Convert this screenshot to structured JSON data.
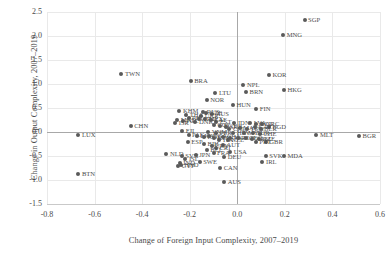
{
  "chart_data": {
    "type": "scatter",
    "title": "",
    "xlabel": "Change of Foreign Input Complexity, 2007–2019",
    "ylabel": "Change in Output Complexity, 2007–2019",
    "xlim": [
      -0.8,
      0.6
    ],
    "ylim": [
      -1.5,
      2.5
    ],
    "xticks": [
      "-0.8",
      "-0.6",
      "-0.4",
      "-0.2",
      "0.0",
      "0.2",
      "0.4",
      "0.6"
    ],
    "xtick_values": [
      -0.8,
      -0.6,
      -0.4,
      -0.2,
      0.0,
      0.2,
      0.4,
      0.6
    ],
    "yticks": [
      "2.5",
      "2.0",
      "1.5",
      "1.0",
      "0.5",
      "0.0",
      "-0.5",
      "-1.0",
      "-1.5"
    ],
    "ytick_values": [
      2.5,
      2.0,
      1.5,
      1.0,
      0.5,
      0.0,
      -0.5,
      -1.0,
      -1.5
    ],
    "grid": true,
    "legend": "none",
    "marker_color": "#5a5a5a",
    "label_color": "#4d4d4d",
    "grid_color": "#e9e9e9",
    "axis_color": "#a8a8a8",
    "points": [
      {
        "label": "SGP",
        "x": 0.283,
        "y": 2.335
      },
      {
        "label": "MNG",
        "x": 0.193,
        "y": 2.02
      },
      {
        "label": "KOR",
        "x": 0.133,
        "y": 1.18
      },
      {
        "label": "TWN",
        "x": -0.487,
        "y": 1.2
      },
      {
        "label": "HKG",
        "x": 0.196,
        "y": 0.88
      },
      {
        "label": "BRA",
        "x": -0.196,
        "y": 1.055
      },
      {
        "label": "NPL",
        "x": 0.026,
        "y": 0.975
      },
      {
        "label": "BRN",
        "x": 0.037,
        "y": 0.83
      },
      {
        "label": "LTU",
        "x": -0.092,
        "y": 0.805
      },
      {
        "label": "NOR",
        "x": -0.128,
        "y": 0.665
      },
      {
        "label": "HUN",
        "x": -0.018,
        "y": 0.56
      },
      {
        "label": "FIN",
        "x": 0.08,
        "y": 0.475
      },
      {
        "label": "KHM",
        "x": -0.243,
        "y": 0.43
      },
      {
        "label": "RUS",
        "x": -0.143,
        "y": 0.415
      },
      {
        "label": "CZE",
        "x": -0.13,
        "y": 0.395
      },
      {
        "label": "AUS2",
        "x": -0.105,
        "y": 0.38
      },
      {
        "label": "MKD",
        "x": -0.252,
        "y": 0.255
      },
      {
        "label": "POL",
        "x": -0.23,
        "y": 0.235
      },
      {
        "label": "ISR",
        "x": -0.261,
        "y": 0.195
      },
      {
        "label": "DNK",
        "x": -0.176,
        "y": 0.21
      },
      {
        "label": "EST",
        "x": -0.088,
        "y": 0.215
      },
      {
        "label": "IDN",
        "x": -0.012,
        "y": 0.19
      },
      {
        "label": "LVA",
        "x": 0.055,
        "y": 0.18
      },
      {
        "label": "ROU",
        "x": 0.08,
        "y": 0.165
      },
      {
        "label": "GRC",
        "x": 0.105,
        "y": 0.16
      },
      {
        "label": "BGD",
        "x": 0.132,
        "y": 0.11
      },
      {
        "label": "CHN",
        "x": -0.448,
        "y": 0.12
      },
      {
        "label": "LUX",
        "x": -0.668,
        "y": -0.055
      },
      {
        "label": "FJI",
        "x": -0.231,
        "y": 0.02
      },
      {
        "label": "VNM",
        "x": -0.122,
        "y": 0.01
      },
      {
        "label": "PER",
        "x": -0.088,
        "y": -0.03
      },
      {
        "label": "HRV",
        "x": -0.016,
        "y": -0.02
      },
      {
        "label": "MYS",
        "x": 0.03,
        "y": -0.015
      },
      {
        "label": "TUR",
        "x": 0.065,
        "y": -0.02
      },
      {
        "label": "CHE",
        "x": 0.095,
        "y": -0.04
      },
      {
        "label": "MLT",
        "x": 0.333,
        "y": -0.055
      },
      {
        "label": "BGR",
        "x": 0.512,
        "y": -0.085
      },
      {
        "label": "ESP",
        "x": -0.208,
        "y": -0.2
      },
      {
        "label": "ITA",
        "x": -0.075,
        "y": -0.16
      },
      {
        "label": "NZL",
        "x": -0.04,
        "y": -0.175
      },
      {
        "label": "GBR",
        "x": 0.12,
        "y": -0.215
      },
      {
        "label": "PRT",
        "x": 0.078,
        "y": -0.205
      },
      {
        "label": "AUT",
        "x": -0.06,
        "y": -0.27
      },
      {
        "label": "NLD",
        "x": -0.298,
        "y": -0.465
      },
      {
        "label": "SVN",
        "x": -0.233,
        "y": -0.51
      },
      {
        "label": "JPN",
        "x": -0.175,
        "y": -0.47
      },
      {
        "label": "DEU",
        "x": -0.055,
        "y": -0.52
      },
      {
        "label": "SWE",
        "x": -0.158,
        "y": -0.615
      },
      {
        "label": "IND",
        "x": -0.242,
        "y": -0.65
      },
      {
        "label": "CYP",
        "x": -0.248,
        "y": -0.705
      },
      {
        "label": "SVK",
        "x": 0.12,
        "y": -0.505
      },
      {
        "label": "MDA",
        "x": 0.196,
        "y": -0.5
      },
      {
        "label": "IRL",
        "x": 0.106,
        "y": -0.635
      },
      {
        "label": "CAN",
        "x": -0.072,
        "y": -0.76
      },
      {
        "label": "AUS",
        "x": -0.055,
        "y": -1.04
      },
      {
        "label": "BTN",
        "x": -0.668,
        "y": -0.865
      },
      {
        "label": "THA",
        "x": -0.215,
        "y": 0.345
      },
      {
        "label": "PHL",
        "x": -0.205,
        "y": 0.3
      },
      {
        "label": "UKR",
        "x": -0.152,
        "y": 0.33
      },
      {
        "label": "ARG",
        "x": -0.163,
        "y": 0.27
      },
      {
        "label": "MEX",
        "x": -0.135,
        "y": 0.265
      },
      {
        "label": "ZAF",
        "x": -0.112,
        "y": 0.245
      },
      {
        "label": "COL",
        "x": -0.098,
        "y": 0.15
      },
      {
        "label": "EGY",
        "x": -0.072,
        "y": 0.13
      },
      {
        "label": "SRB",
        "x": -0.046,
        "y": 0.095
      },
      {
        "label": "CHL",
        "x": -0.033,
        "y": 0.06
      },
      {
        "label": "MAR",
        "x": 0.01,
        "y": 0.075
      },
      {
        "label": "TUN",
        "x": 0.04,
        "y": 0.055
      },
      {
        "label": "KAZ",
        "x": 0.073,
        "y": 0.1
      },
      {
        "label": "BLR",
        "x": 0.098,
        "y": 0.06
      },
      {
        "label": "PAK",
        "x": -0.205,
        "y": -0.06
      },
      {
        "label": "LKA",
        "x": -0.17,
        "y": -0.075
      },
      {
        "label": "KGZ",
        "x": -0.14,
        "y": -0.1
      },
      {
        "label": "NGA",
        "x": -0.118,
        "y": -0.09
      },
      {
        "label": "KEN",
        "x": -0.098,
        "y": -0.12
      },
      {
        "label": "GHA",
        "x": -0.06,
        "y": -0.105
      },
      {
        "label": "JOR",
        "x": -0.03,
        "y": -0.115
      },
      {
        "label": "ALB",
        "x": 0.005,
        "y": -0.13
      },
      {
        "label": "GEO",
        "x": 0.035,
        "y": -0.135
      },
      {
        "label": "ARM",
        "x": 0.062,
        "y": -0.15
      },
      {
        "label": "AZE",
        "x": 0.09,
        "y": -0.145
      },
      {
        "label": "BIH",
        "x": -0.14,
        "y": -0.255
      },
      {
        "label": "URY",
        "x": -0.108,
        "y": -0.3
      },
      {
        "label": "CRI",
        "x": -0.09,
        "y": -0.34
      },
      {
        "label": "BEL",
        "x": -0.128,
        "y": -0.385
      },
      {
        "label": "FRA",
        "x": -0.1,
        "y": -0.43
      },
      {
        "label": "USA",
        "x": -0.03,
        "y": -0.42
      },
      {
        "label": "ISL",
        "x": -0.218,
        "y": -0.56
      },
      {
        "label": "HND",
        "x": -0.238,
        "y": -0.68
      }
    ]
  }
}
